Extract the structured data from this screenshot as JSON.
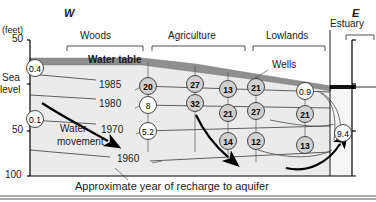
{
  "figure": {
    "title_caption": "Approximate year of recharge to aquifer",
    "compass_west": "W",
    "compass_east": "E",
    "units_label": "(feet)"
  },
  "axis": {
    "name": "elevation-axis",
    "ticks": [
      {
        "label": "50",
        "y_px": 37
      },
      {
        "label": "Sea",
        "y_px": 80
      },
      {
        "label": "level",
        "y_px": 90
      },
      {
        "label": "50",
        "y_px": 129
      },
      {
        "label": "100",
        "y_px": 171
      }
    ],
    "top_value": "50",
    "sea_level_line1": "Sea",
    "sea_level_line2": "level",
    "mid_value": "50",
    "bottom_value": "100"
  },
  "landuse_brackets": [
    {
      "label": "Woods",
      "x1": 67,
      "x2": 143,
      "text_x": 80,
      "text_y": 31
    },
    {
      "label": "Agriculture",
      "x1": 152,
      "x2": 245,
      "text_x": 168,
      "text_y": 31
    },
    {
      "label": "Lowlands",
      "x1": 253,
      "x2": 325,
      "text_x": 266,
      "text_y": 31
    },
    {
      "label": "Estuary",
      "x1": 346,
      "x2": 374,
      "text_x": 334,
      "text_y": 20
    }
  ],
  "annotations": [
    {
      "name": "water-table-label",
      "text": "Water table",
      "x": 88,
      "y": 61
    },
    {
      "name": "wells-label",
      "text": "Wells",
      "x": 272,
      "y": 66
    },
    {
      "name": "water-movement-label-1",
      "text": "Water",
      "x": 60,
      "y": 130
    },
    {
      "name": "water-movement-label-2",
      "text": "movement",
      "x": 57,
      "y": 143
    }
  ],
  "recharge_years": [
    {
      "label": "1985",
      "x": 108,
      "y": 86
    },
    {
      "label": "1980",
      "x": 108,
      "y": 105
    },
    {
      "label": "1970",
      "x": 110,
      "y": 131
    },
    {
      "label": "1960",
      "x": 126,
      "y": 160
    }
  ],
  "chart_data": {
    "type": "scatter",
    "xlabel": "West to East transect",
    "ylabel": "Elevation (feet)",
    "ylim": [
      -100,
      50
    ],
    "grid": false,
    "legend": "none",
    "wells": [
      {
        "value": "0.4",
        "cx": 35,
        "cy": 68,
        "bold": false,
        "fill": "white"
      },
      {
        "value": "0.1",
        "cx": 35,
        "cy": 119,
        "bold": false,
        "fill": "white"
      },
      {
        "value": "20",
        "cx": 148,
        "cy": 86,
        "bold": true,
        "fill": "shade"
      },
      {
        "value": "8",
        "cx": 148,
        "cy": 105,
        "bold": false,
        "fill": "white"
      },
      {
        "value": "5.2",
        "cx": 148,
        "cy": 131,
        "bold": false,
        "fill": "white"
      },
      {
        "value": "27",
        "cx": 195,
        "cy": 84,
        "bold": true,
        "fill": "shade"
      },
      {
        "value": "32",
        "cx": 195,
        "cy": 103,
        "bold": true,
        "fill": "shade"
      },
      {
        "value": "13",
        "cx": 228,
        "cy": 89,
        "bold": true,
        "fill": "shade"
      },
      {
        "value": "21",
        "cx": 228,
        "cy": 113,
        "bold": true,
        "fill": "shade"
      },
      {
        "value": "14",
        "cx": 228,
        "cy": 141,
        "bold": true,
        "fill": "shade"
      },
      {
        "value": "21",
        "cx": 256,
        "cy": 87,
        "bold": true,
        "fill": "shade"
      },
      {
        "value": "27",
        "cx": 256,
        "cy": 111,
        "bold": true,
        "fill": "shade"
      },
      {
        "value": "12",
        "cx": 256,
        "cy": 141,
        "bold": true,
        "fill": "shade"
      },
      {
        "value": "0.9",
        "cx": 305,
        "cy": 91,
        "bold": false,
        "fill": "white"
      },
      {
        "value": "21",
        "cx": 305,
        "cy": 114,
        "bold": true,
        "fill": "shade"
      },
      {
        "value": "13",
        "cx": 305,
        "cy": 145,
        "bold": true,
        "fill": "shade"
      },
      {
        "value": "9.4",
        "cx": 343,
        "cy": 133,
        "bold": false,
        "fill": "white"
      }
    ]
  },
  "colors": {
    "water_table_band": "#8c8c8c",
    "aquifer_fill": "#eaeaea",
    "well_shade": "#d0d0d0",
    "line": "#000000"
  }
}
